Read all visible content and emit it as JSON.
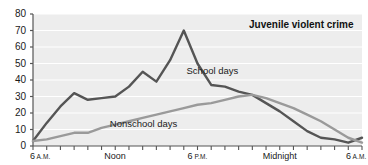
{
  "chart_data": {
    "type": "line",
    "title": "Juvenile violent crime",
    "xlabel": "",
    "ylabel": "",
    "ylim": [
      0,
      80
    ],
    "yticks": [
      0,
      10,
      20,
      30,
      40,
      50,
      60,
      70,
      80
    ],
    "grid": true,
    "legend_position": "inline-annotations",
    "x_axis_hours": "6 A.M. through 6 A.M. next day, hourly ticks",
    "xtick_labels": [
      {
        "text": "6",
        "ampm": "A.M.",
        "hour": 6
      },
      {
        "text": "Noon",
        "ampm": "",
        "hour": 12
      },
      {
        "text": "6",
        "ampm": "P.M.",
        "hour": 18
      },
      {
        "text": "Midnight",
        "ampm": "",
        "hour": 24
      },
      {
        "text": "6",
        "ampm": "A.M.",
        "hour": 30
      }
    ],
    "x": [
      6,
      7,
      8,
      9,
      10,
      11,
      12,
      13,
      14,
      15,
      16,
      17,
      18,
      19,
      20,
      21,
      22,
      23,
      24,
      25,
      26,
      27,
      28,
      29,
      30
    ],
    "series": [
      {
        "name": "School days",
        "color": "#555555",
        "values": [
          3,
          14,
          24,
          32,
          28,
          29,
          30,
          36,
          45,
          39,
          52,
          70,
          50,
          37,
          36,
          33,
          31,
          26,
          21,
          15,
          9,
          5,
          4,
          2,
          5
        ]
      },
      {
        "name": "Nonschool days",
        "color": "#9a9a9a",
        "values": [
          3,
          4,
          6,
          8,
          8,
          11,
          13,
          15,
          17,
          19,
          21,
          23,
          25,
          26,
          28,
          30,
          31,
          29,
          26,
          23,
          19,
          15,
          10,
          5,
          2
        ]
      }
    ],
    "annotations": [
      {
        "text": "School days",
        "x_hour": 17.2,
        "y_value": 46
      },
      {
        "text": "Nonschool days",
        "x_hour": 11.6,
        "y_value": 14
      }
    ]
  },
  "style": {
    "plot_background": "#ededed",
    "gridline_color": "#ffffff",
    "axis_color": "#555555",
    "text_color": "#1a1a1a"
  }
}
